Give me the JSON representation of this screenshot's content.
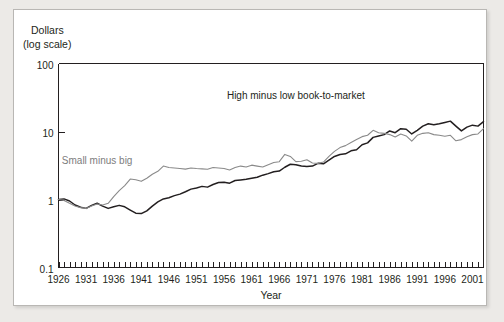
{
  "figure": {
    "background_color": "#eceae7",
    "card_color": "#ffffff",
    "border_color": "#b9b7b4"
  },
  "chart_data": {
    "type": "line",
    "title": "",
    "xlabel": "Year",
    "ylabel": "Dollars",
    "ylabel_line2": "(log scale)",
    "yscale": "log",
    "ylim": [
      0.1,
      100
    ],
    "ytick_labels": [
      "100",
      "10",
      "1",
      "0.1"
    ],
    "ytick_values": [
      100,
      10,
      1,
      0.1
    ],
    "xlim": [
      1926,
      2003
    ],
    "xtick_labels": [
      "1926",
      "1931",
      "1936",
      "1941",
      "1946",
      "1951",
      "1956",
      "1961",
      "1966",
      "1971",
      "1976",
      "1981",
      "1986",
      "1991",
      "1996",
      "2001"
    ],
    "xtick_values": [
      1926,
      1931,
      1936,
      1941,
      1946,
      1951,
      1956,
      1961,
      1966,
      1971,
      1976,
      1981,
      1986,
      1991,
      1996,
      2001
    ],
    "xtick_minor_step": 1,
    "grid": false,
    "legend": "inline-annotations",
    "series": [
      {
        "name": "High minus low book-to-market",
        "color": "#231f20",
        "label_x": 1969,
        "label_y": 30,
        "x": [
          1926,
          1927,
          1928,
          1929,
          1930,
          1931,
          1932,
          1933,
          1934,
          1935,
          1936,
          1937,
          1938,
          1939,
          1940,
          1941,
          1942,
          1943,
          1944,
          1945,
          1946,
          1947,
          1948,
          1949,
          1950,
          1951,
          1952,
          1953,
          1954,
          1955,
          1956,
          1957,
          1958,
          1959,
          1960,
          1961,
          1962,
          1963,
          1964,
          1965,
          1966,
          1967,
          1968,
          1969,
          1970,
          1971,
          1972,
          1973,
          1974,
          1975,
          1976,
          1977,
          1978,
          1979,
          1980,
          1981,
          1982,
          1983,
          1984,
          1985,
          1986,
          1987,
          1988,
          1989,
          1990,
          1991,
          1992,
          1993,
          1994,
          1995,
          1996,
          1997,
          1998,
          1999,
          2000,
          2001,
          2002,
          2003
        ],
        "y": [
          1.0,
          1.02,
          0.95,
          0.83,
          0.77,
          0.74,
          0.82,
          0.88,
          0.8,
          0.74,
          0.78,
          0.82,
          0.78,
          0.7,
          0.63,
          0.62,
          0.68,
          0.8,
          0.92,
          1.02,
          1.06,
          1.14,
          1.2,
          1.3,
          1.42,
          1.48,
          1.56,
          1.52,
          1.66,
          1.78,
          1.8,
          1.74,
          1.9,
          1.94,
          1.98,
          2.05,
          2.12,
          2.28,
          2.4,
          2.56,
          2.62,
          2.98,
          3.3,
          3.25,
          3.1,
          3.05,
          3.1,
          3.4,
          3.35,
          3.8,
          4.3,
          4.6,
          4.7,
          5.2,
          5.4,
          6.4,
          6.8,
          8.2,
          8.6,
          9.0,
          10.2,
          9.6,
          11.0,
          10.8,
          9.2,
          10.4,
          12.0,
          13.0,
          12.6,
          13.0,
          13.6,
          14.2,
          12.0,
          10.2,
          11.6,
          12.4,
          12.0,
          14.0
        ]
      },
      {
        "name": "Small minus big",
        "color": "#8a8a8a",
        "label_x": 1933,
        "label_y": 3.3,
        "x": [
          1926,
          1927,
          1928,
          1929,
          1930,
          1931,
          1932,
          1933,
          1934,
          1935,
          1936,
          1937,
          1938,
          1939,
          1940,
          1941,
          1942,
          1943,
          1944,
          1945,
          1946,
          1947,
          1948,
          1949,
          1950,
          1951,
          1952,
          1953,
          1954,
          1955,
          1956,
          1957,
          1958,
          1959,
          1960,
          1961,
          1962,
          1963,
          1964,
          1965,
          1966,
          1967,
          1968,
          1969,
          1970,
          1971,
          1972,
          1973,
          1974,
          1975,
          1976,
          1977,
          1978,
          1979,
          1980,
          1981,
          1982,
          1983,
          1984,
          1985,
          1986,
          1987,
          1988,
          1989,
          1990,
          1991,
          1992,
          1993,
          1994,
          1995,
          1996,
          1997,
          1998,
          1999,
          2000,
          2001,
          2002,
          2003
        ],
        "y": [
          1.0,
          0.97,
          0.88,
          0.8,
          0.76,
          0.74,
          0.8,
          0.86,
          0.83,
          0.88,
          1.1,
          1.35,
          1.6,
          2.0,
          1.95,
          1.85,
          2.05,
          2.35,
          2.6,
          3.1,
          2.95,
          2.9,
          2.85,
          2.8,
          2.9,
          2.85,
          2.82,
          2.78,
          2.95,
          2.9,
          2.85,
          2.72,
          2.95,
          3.1,
          3.0,
          3.2,
          3.1,
          3.0,
          3.25,
          3.5,
          3.6,
          4.6,
          4.3,
          3.6,
          3.65,
          3.85,
          3.45,
          3.4,
          3.55,
          4.3,
          5.1,
          5.8,
          6.2,
          6.9,
          7.6,
          8.4,
          8.8,
          10.4,
          9.6,
          9.4,
          9.0,
          8.3,
          9.2,
          8.6,
          7.2,
          8.8,
          9.4,
          9.6,
          9.0,
          8.8,
          8.5,
          8.8,
          7.3,
          7.6,
          8.4,
          9.0,
          9.2,
          11.0
        ]
      }
    ]
  }
}
